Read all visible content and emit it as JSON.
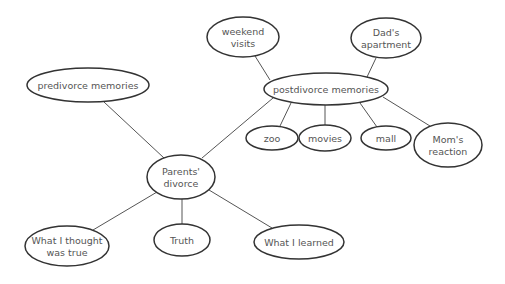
{
  "diagram": {
    "type": "cluster-map",
    "nodes": [
      {
        "id": "parents_divorce",
        "lines": [
          "Parents'",
          "divorce"
        ],
        "cx": 181,
        "cy": 177,
        "rx": 34,
        "ry": 22
      },
      {
        "id": "predivorce",
        "lines": [
          "predivorce memories"
        ],
        "cx": 88,
        "cy": 85,
        "rx": 61,
        "ry": 17
      },
      {
        "id": "postdivorce",
        "lines": [
          "postdivorce memories"
        ],
        "cx": 326,
        "cy": 89,
        "rx": 62,
        "ry": 16
      },
      {
        "id": "weekend_visits",
        "lines": [
          "weekend",
          "visits"
        ],
        "cx": 243,
        "cy": 37,
        "rx": 36,
        "ry": 20
      },
      {
        "id": "dads_apartment",
        "lines": [
          "Dad's",
          "apartment"
        ],
        "cx": 386,
        "cy": 38,
        "rx": 35,
        "ry": 20
      },
      {
        "id": "zoo",
        "lines": [
          "zoo"
        ],
        "cx": 272,
        "cy": 138,
        "rx": 26,
        "ry": 12
      },
      {
        "id": "movies",
        "lines": [
          "movies"
        ],
        "cx": 325,
        "cy": 138,
        "rx": 26,
        "ry": 13
      },
      {
        "id": "mall",
        "lines": [
          "mall"
        ],
        "cx": 386,
        "cy": 138,
        "rx": 25,
        "ry": 12
      },
      {
        "id": "moms_reaction",
        "lines": [
          "Mom's",
          "reaction"
        ],
        "cx": 448,
        "cy": 145,
        "rx": 34,
        "ry": 22
      },
      {
        "id": "what_i_thought",
        "lines": [
          "What I thought",
          "was true"
        ],
        "cx": 67,
        "cy": 246,
        "rx": 42,
        "ry": 20
      },
      {
        "id": "truth",
        "lines": [
          "Truth"
        ],
        "cx": 182,
        "cy": 240,
        "rx": 28,
        "ry": 16
      },
      {
        "id": "what_i_learned",
        "lines": [
          "What I learned"
        ],
        "cx": 299,
        "cy": 242,
        "rx": 45,
        "ry": 17
      }
    ],
    "edges": [
      {
        "from": "parents_divorce",
        "to": "predivorce",
        "x1": 164,
        "y1": 158,
        "x2": 104,
        "y2": 102
      },
      {
        "from": "parents_divorce",
        "to": "postdivorce",
        "x1": 202,
        "y1": 158,
        "x2": 273,
        "y2": 98
      },
      {
        "from": "parents_divorce",
        "to": "what_i_thought",
        "x1": 157,
        "y1": 192,
        "x2": 93,
        "y2": 230
      },
      {
        "from": "parents_divorce",
        "to": "truth",
        "x1": 182,
        "y1": 199,
        "x2": 182,
        "y2": 224
      },
      {
        "from": "parents_divorce",
        "to": "what_i_learned",
        "x1": 209,
        "y1": 190,
        "x2": 272,
        "y2": 228
      },
      {
        "from": "postdivorce",
        "to": "weekend_visits",
        "x1": 270,
        "y1": 80,
        "x2": 255,
        "y2": 56
      },
      {
        "from": "postdivorce",
        "to": "dads_apartment",
        "x1": 367,
        "y1": 77,
        "x2": 376,
        "y2": 58
      },
      {
        "from": "postdivorce",
        "to": "zoo",
        "x1": 291,
        "y1": 103,
        "x2": 280,
        "y2": 126
      },
      {
        "from": "postdivorce",
        "to": "movies",
        "x1": 325,
        "y1": 105,
        "x2": 325,
        "y2": 125
      },
      {
        "from": "postdivorce",
        "to": "mall",
        "x1": 360,
        "y1": 103,
        "x2": 377,
        "y2": 127
      },
      {
        "from": "postdivorce",
        "to": "moms_reaction",
        "x1": 383,
        "y1": 97,
        "x2": 430,
        "y2": 126
      }
    ]
  }
}
